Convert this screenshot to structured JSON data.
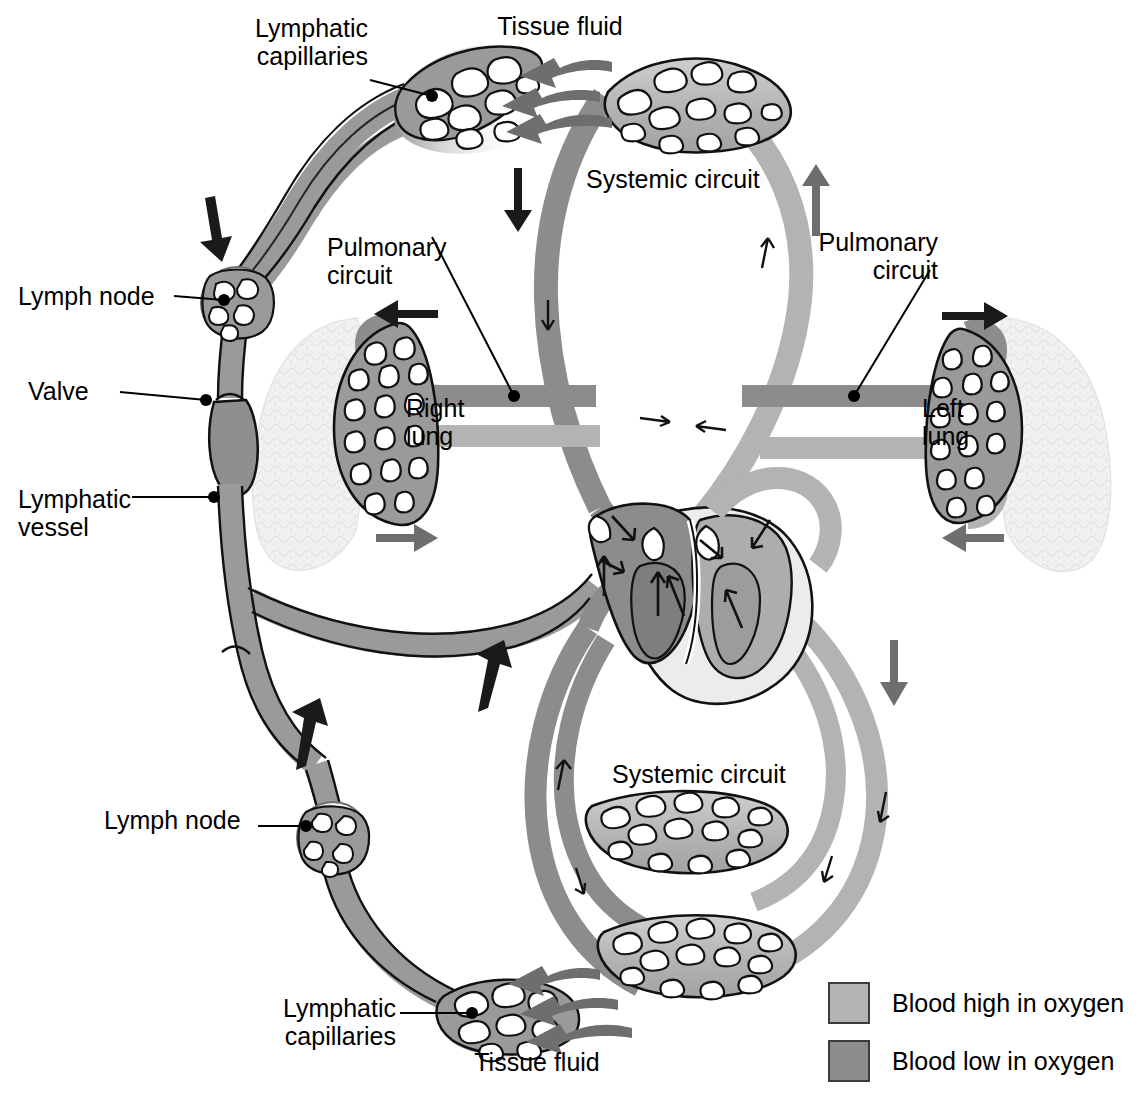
{
  "figure": {
    "type": "anatomical-diagram"
  },
  "colors": {
    "oxygen_high": "#b3b3b3",
    "oxygen_low": "#8c8c8c",
    "lymph_vessel": "#9a9a9a",
    "lung_tissue": "#efefef",
    "heart_light": "#eeeeee",
    "outline": "#111111",
    "arrow_dark": "#1a1a1a",
    "arrow_gray": "#6e6e6e"
  },
  "labels": {
    "lymphatic_capillaries_top": "Lymphatic\ncapillaries",
    "tissue_fluid_top": "Tissue fluid",
    "systemic_circuit_top": "Systemic circuit",
    "pulmonary_circuit_left": "Pulmonary\ncircuit",
    "pulmonary_circuit_right": "Pulmonary\ncircuit",
    "lymph_node_upper": "Lymph node",
    "valve": "Valve",
    "lymphatic_vessel": "Lymphatic\nvessel",
    "right_lung": "Right\nlung",
    "left_lung": "Left\nlung",
    "lymph_node_lower": "Lymph node",
    "systemic_circuit_bottom": "Systemic circuit",
    "lymphatic_capillaries_bottom": "Lymphatic\ncapillaries",
    "tissue_fluid_bottom": "Tissue fluid"
  },
  "legend": {
    "items": [
      {
        "label": "Blood high in oxygen",
        "color": "#b3b3b3",
        "swatch_name": "oxygen-high-swatch"
      },
      {
        "label": "Blood low in oxygen",
        "color": "#8c8c8c",
        "swatch_name": "oxygen-low-swatch"
      }
    ]
  },
  "structures": {
    "lungs": [
      "Right lung",
      "Left lung"
    ],
    "circuits": [
      "Systemic circuit",
      "Pulmonary circuit"
    ],
    "lymphatic": [
      "Lymphatic capillaries",
      "Lymphatic vessel",
      "Lymph node",
      "Valve"
    ],
    "heart_chambers": 4
  }
}
